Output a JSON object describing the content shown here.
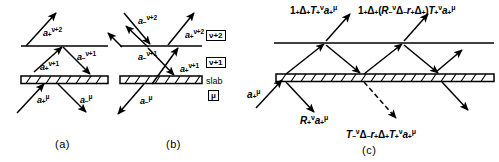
{
  "figure": {
    "type": "physics-ray-diagram",
    "background": "#ffffff",
    "ink": "#000000"
  },
  "panels": [
    {
      "id": "a",
      "caption": "(a)",
      "labels": [
        {
          "base": "a",
          "sub": "+",
          "sup": "ν+2"
        },
        {
          "base": "a",
          "sub": "−",
          "sup": "ν+1"
        },
        {
          "base": "a",
          "sub": "+",
          "sup": "ν+1"
        },
        {
          "base": "a",
          "sub": "+",
          "sup": "μ"
        },
        {
          "base": "a",
          "sub": "−",
          "sup": "μ"
        }
      ]
    },
    {
      "id": "b",
      "caption": "(b)",
      "labels": [
        {
          "base": "a",
          "sub": "−",
          "sup": "ν+2"
        },
        {
          "base": "a",
          "sub": "+",
          "sup": "ν+2"
        },
        {
          "base": "a",
          "sub": "−",
          "sup": "ν+1"
        },
        {
          "base": "a",
          "sub": "+",
          "sup": "ν+1"
        },
        {
          "base": "a",
          "sub": "−",
          "sup": "μ"
        }
      ]
    },
    {
      "id": "c",
      "caption": "(c)",
      "labels": [
        {
          "id": "incident",
          "text": "a"
        },
        {
          "id": "out1",
          "text": "1"
        },
        {
          "id": "out2",
          "text": "1"
        },
        {
          "id": "refl",
          "text": "R"
        },
        {
          "id": "trans",
          "text": "T"
        }
      ]
    }
  ],
  "text": {
    "caption_a": "(a)",
    "caption_b": "(b)",
    "caption_c": "(c)",
    "layer_nu2": "ν+2",
    "layer_nu1": "ν+1",
    "slab": "slab",
    "layer_mu": "μ",
    "a_plus_nu2": "a",
    "a_minus_nu2": "a",
    "a_minus_nu1": "a",
    "a_plus_nu1": "a",
    "a_plus_mu": "a",
    "a_minus_mu": "a",
    "sub_plus": "+",
    "sub_minus": "−",
    "sup_nu2": "ν+2",
    "sup_nu1": "ν+1",
    "sup_nu": "ν",
    "sup_mu": "μ",
    "one": "1",
    "delta": "Δ",
    "cap_T": "T",
    "cap_R": "R",
    "low_r": "r",
    "paren_open": "(",
    "paren_close": ")"
  },
  "formulas": {
    "c_top_left": "1₊Δ₊T₊ᵝ a₊ᵘ",
    "c_top_right": "1₊Δ₊(R₋ᵝΔ₋r₊Δ₊)T₊ᵝ a₊ᵘ",
    "c_incident": "a₊ᵘ",
    "c_reflected": "R₊ᵝ a₊ᵘ",
    "c_transmitted": "T₋ᵝΔ₋r₊Δ₊T₊ᵝ a₊ᵘ"
  },
  "geometry": {
    "panel_a_x": 0,
    "panel_b_x": 112,
    "panel_c_x": 246,
    "interface_y": 46,
    "slab_y": 78,
    "slab_thickness": 8,
    "line_width": 1.4
  }
}
